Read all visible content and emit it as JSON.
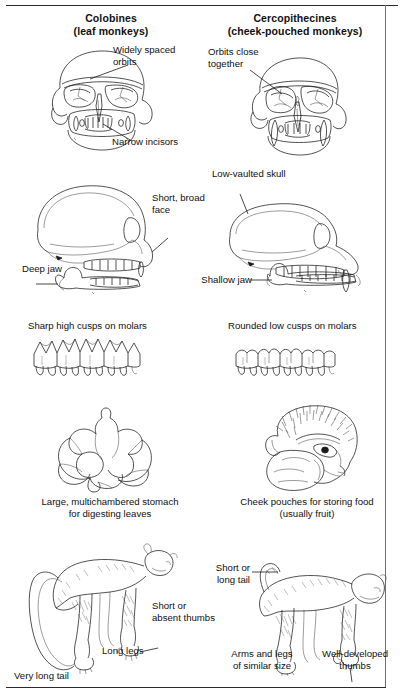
{
  "figure": {
    "type": "comparative-anatomy-diagram",
    "columns": [
      {
        "id": "colobines",
        "title": "Colobines",
        "subtitle": "(leaf monkeys)"
      },
      {
        "id": "cercopithecines",
        "title": "Cercopithecines",
        "subtitle": "(cheek-pouched monkeys)"
      }
    ],
    "rows": [
      {
        "id": "skull-frontal",
        "left": {
          "illustration": "colobine-skull-front-view",
          "labels": [
            "Widely spaced\norbits",
            "Narrow incisors"
          ]
        },
        "right": {
          "illustration": "cercopithecine-skull-front-view",
          "labels": [
            "Orbits close\ntogether"
          ]
        }
      },
      {
        "id": "skull-lateral",
        "left": {
          "illustration": "colobine-skull-side-view",
          "labels": [
            "Short, broad\nface",
            "Deep jaw"
          ]
        },
        "right": {
          "illustration": "cercopithecine-skull-side-view",
          "labels": [
            "Low-vaulted skull",
            "Shallow jaw"
          ]
        }
      },
      {
        "id": "molars",
        "left": {
          "illustration": "colobine-molar-row",
          "labels": [
            "Sharp high cusps on molars"
          ]
        },
        "right": {
          "illustration": "cercopithecine-molar-row",
          "labels": [
            "Rounded low cusps on molars"
          ]
        }
      },
      {
        "id": "digestion",
        "left": {
          "illustration": "sacculated-stomach",
          "labels": [
            "Large, multichambered stomach\nfor digesting leaves"
          ]
        },
        "right": {
          "illustration": "cheek-pouch-head",
          "labels": [
            "Cheek pouches for storing food\n(usually fruit)"
          ]
        }
      },
      {
        "id": "body-limbs",
        "left": {
          "illustration": "colobine-body",
          "labels": [
            "Short or\nabsent thumbs",
            "Long legs",
            "Very long tail"
          ]
        },
        "right": {
          "illustration": "cercopithecine-body",
          "labels": [
            "Short or\nlong tail",
            "Arms and legs\nof similar size",
            "Well-developed\nthumbs"
          ]
        }
      }
    ],
    "labels": {
      "widely_spaced_orbits": "Widely spaced\norbits",
      "narrow_incisors": "Narrow incisors",
      "orbits_close_together": "Orbits close\ntogether",
      "short_broad_face": "Short, broad\nface",
      "deep_jaw": "Deep jaw",
      "low_vaulted_skull": "Low-vaulted skull",
      "shallow_jaw": "Shallow jaw",
      "sharp_high_cusps": "Sharp high cusps on molars",
      "rounded_low_cusps": "Rounded low cusps on molars",
      "stomach_caption": "Large, multichambered stomach\nfor digesting leaves",
      "cheek_pouch_caption": "Cheek pouches for storing food\n(usually fruit)",
      "short_or_absent_thumbs": "Short or\nabsent thumbs",
      "long_legs": "Long legs",
      "very_long_tail": "Very long tail",
      "short_or_long_tail": "Short or\nlong tail",
      "arms_legs_similar": "Arms and legs\nof similar size",
      "well_developed_thumbs": "Well-developed\nthumbs"
    },
    "colors": {
      "ink": "#1a1a1a",
      "rule": "#2b2b2b",
      "shading": "#555555",
      "background": "#ffffff"
    }
  }
}
